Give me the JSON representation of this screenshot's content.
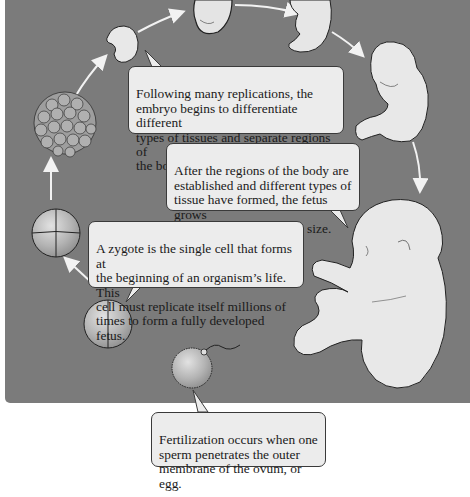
{
  "diagram": {
    "background_color": "#7b7b7b",
    "callout_fill": "#ececec",
    "arrow_color": "#f2f2f2",
    "stages": [
      {
        "id": "zygote",
        "label": "Fertilized ovum with sperm"
      },
      {
        "id": "two-cell",
        "label": "Two-cell stage"
      },
      {
        "id": "four-cell",
        "label": "Four-cell stage"
      },
      {
        "id": "morula",
        "label": "Morula / blastocyst"
      },
      {
        "id": "early-embryo",
        "label": "Early embryo"
      },
      {
        "id": "embryo",
        "label": "Embryo"
      },
      {
        "id": "late-embryo",
        "label": "Late embryo"
      },
      {
        "id": "early-fetus",
        "label": "Fetus"
      },
      {
        "id": "full-term-fetus",
        "label": "Full-term fetus"
      }
    ],
    "callouts": {
      "differentiation": "Following many replications, the\nembryo begins to differentiate different\ntypes of tissues and separate regions of\nthe body, such as the head and limbs.",
      "growth": "After the regions of the body are\nestablished and different types of\ntissue have formed, the fetus grows\nuntil it reaches full-term size.",
      "zygote": "A zygote is the single cell that forms at\nthe beginning of an organism’s life. This\ncell must replicate itself millions of\ntimes to form a fully developed fetus.",
      "fertilization": "Fertilization occurs when one\nsperm penetrates the outer\nmembrane of the ovum, or egg."
    }
  }
}
